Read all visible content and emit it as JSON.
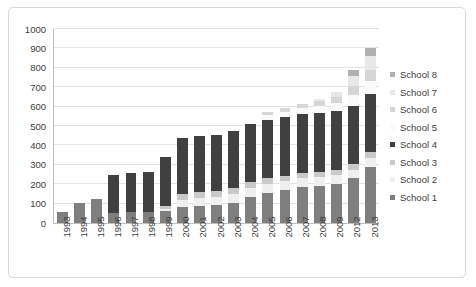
{
  "chart_data": {
    "type": "bar",
    "stacked": true,
    "title": "",
    "xlabel": "",
    "ylabel": "",
    "ylim": [
      0,
      1000
    ],
    "ytick_step": 100,
    "yticks": [
      0,
      100,
      200,
      300,
      400,
      500,
      600,
      700,
      800,
      900,
      1000
    ],
    "grid": true,
    "legend_position": "right",
    "categories": [
      "1993",
      "1994",
      "1995",
      "1996",
      "1997",
      "1998",
      "1999",
      "2000",
      "2001",
      "2002",
      "2003",
      "2004",
      "2005",
      "2006",
      "2007",
      "2008",
      "2009",
      "2012",
      "2013"
    ],
    "series": [
      {
        "name": "School 1",
        "color": "#7f7f7f",
        "values": [
          55,
          105,
          125,
          50,
          55,
          55,
          60,
          85,
          90,
          95,
          105,
          135,
          155,
          170,
          185,
          190,
          200,
          230,
          290
        ]
      },
      {
        "name": "School 2",
        "color": "#efefef",
        "values": [
          0,
          0,
          0,
          0,
          0,
          0,
          10,
          35,
          40,
          40,
          45,
          45,
          45,
          45,
          45,
          45,
          45,
          45,
          45
        ]
      },
      {
        "name": "School 3",
        "color": "#c9c9c9",
        "values": [
          0,
          0,
          0,
          0,
          0,
          0,
          20,
          30,
          30,
          30,
          30,
          30,
          30,
          30,
          30,
          30,
          30,
          30,
          30
        ]
      },
      {
        "name": "School 4",
        "color": "#404040",
        "values": [
          0,
          0,
          0,
          200,
          205,
          210,
          250,
          290,
          290,
          290,
          295,
          300,
          300,
          300,
          300,
          300,
          300,
          300,
          300
        ]
      },
      {
        "name": "School 5",
        "color": "#fafafa",
        "values": [
          0,
          0,
          0,
          0,
          0,
          0,
          0,
          0,
          0,
          0,
          10,
          20,
          25,
          30,
          35,
          40,
          45,
          55,
          65
        ]
      },
      {
        "name": "School 6",
        "color": "#d6d6d6",
        "values": [
          0,
          0,
          0,
          0,
          0,
          0,
          0,
          0,
          0,
          0,
          0,
          0,
          15,
          20,
          20,
          25,
          30,
          45,
          60
        ]
      },
      {
        "name": "School 7",
        "color": "#e8e8e8",
        "values": [
          0,
          0,
          0,
          0,
          0,
          0,
          0,
          0,
          0,
          0,
          0,
          0,
          0,
          0,
          0,
          10,
          25,
          55,
          70
        ]
      },
      {
        "name": "School 8",
        "color": "#b0b0b0",
        "values": [
          0,
          0,
          0,
          0,
          0,
          0,
          0,
          0,
          0,
          0,
          0,
          0,
          0,
          0,
          0,
          0,
          0,
          30,
          45
        ]
      }
    ]
  },
  "legend": {
    "entries": [
      {
        "label": "School 8",
        "color": "#b0b0b0"
      },
      {
        "label": "School 7",
        "color": "#e8e8e8"
      },
      {
        "label": "School 6",
        "color": "#d6d6d6"
      },
      {
        "label": "School 5",
        "color": "#fafafa"
      },
      {
        "label": "School 4",
        "color": "#404040"
      },
      {
        "label": "School 3",
        "color": "#c9c9c9"
      },
      {
        "label": "School 2",
        "color": "#efefef"
      },
      {
        "label": "School 1",
        "color": "#7f7f7f"
      }
    ]
  }
}
